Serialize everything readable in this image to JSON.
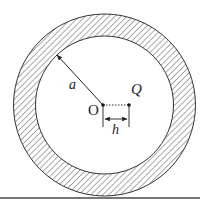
{
  "diagram": {
    "type": "annular-region",
    "labels": {
      "radius": "a",
      "center": "O",
      "point": "Q",
      "offset": "h"
    },
    "colors": {
      "stroke": "#333333",
      "hatch": "#444444",
      "bottom_rule": "#777777"
    }
  }
}
